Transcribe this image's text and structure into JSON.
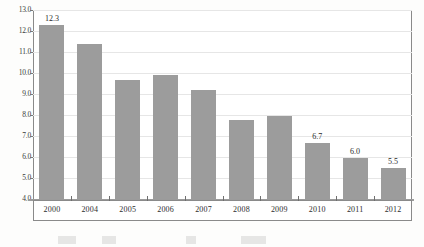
{
  "chart_data": {
    "type": "bar",
    "title": "",
    "subtitle": "",
    "xlabel": "",
    "ylabel": "",
    "categories": [
      "2000",
      "2004",
      "2005",
      "2006",
      "2007",
      "2008",
      "2009",
      "2010",
      "2011",
      "2012"
    ],
    "values": [
      12.3,
      11.4,
      9.7,
      9.9,
      9.2,
      7.8,
      8.0,
      6.7,
      6.0,
      5.5
    ],
    "data_labels": [
      "12.3",
      "",
      "",
      "",
      "",
      "",
      "",
      "6.7",
      "6.0",
      "5.5"
    ],
    "ylim": [
      4.0,
      13.0
    ],
    "yticks": [
      4.0,
      5.0,
      6.0,
      7.0,
      8.0,
      9.0,
      10.0,
      11.0,
      12.0,
      13.0
    ],
    "ytick_labels": [
      "4.0",
      "5.0",
      "6.0",
      "7.0",
      "8.0",
      "9.0",
      "10.0",
      "11.0",
      "12.0",
      "13.0"
    ],
    "grid": true,
    "legend": false,
    "legend_position": "none",
    "series": [
      {
        "name": "",
        "values": [
          12.3,
          11.4,
          9.7,
          9.9,
          9.2,
          7.8,
          8.0,
          6.7,
          6.0,
          5.5
        ]
      }
    ]
  },
  "style": {
    "bar_color": "#9c9c9c",
    "grid_color": "#e6e6e6",
    "frame_color": "#8a8a8a",
    "axis_color": "#9b9b9b",
    "text_color": "#2d2d2d",
    "background": "#ffffff"
  }
}
